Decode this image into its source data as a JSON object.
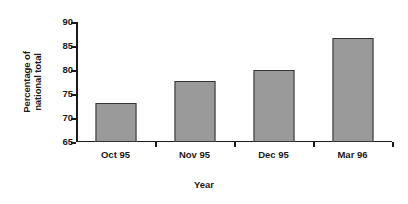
{
  "chart_data": {
    "type": "bar",
    "title": "",
    "subtitle": "",
    "xlabel": "Year",
    "ylabel": "Percentage of national total",
    "ylabel_lines": [
      "Percentage of",
      "national total"
    ],
    "categories": [
      "Oct 95",
      "Nov 95",
      "Dec 95",
      "Mar 96"
    ],
    "values": [
      73.1,
      77.8,
      79.9,
      86.7
    ],
    "series": [
      {
        "name": "Percentage of national total",
        "values": [
          73.1,
          77.8,
          79.9,
          86.7
        ]
      }
    ],
    "ylim": [
      65,
      90
    ],
    "yticks": [
      65,
      70,
      75,
      80,
      85,
      90
    ],
    "ytick_labels": [
      "65",
      "70",
      "75",
      "80",
      "85",
      "90"
    ],
    "grid": false,
    "legend": false,
    "legend_position": "none",
    "annotations": [],
    "colors": {
      "bar_fill": "#9a9a9a",
      "bar_border": "#333333",
      "axis": "#1a1a1a",
      "text": "#1a1a1a",
      "background": "#ffffff"
    }
  }
}
